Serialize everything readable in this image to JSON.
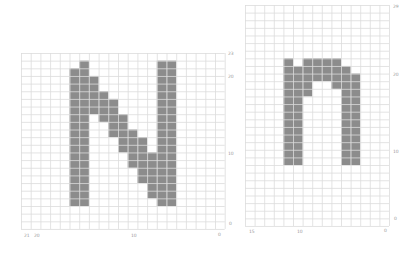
{
  "panels": [
    {
      "id": "left",
      "glyph": "N",
      "origin": [
        21,
        53
      ],
      "cols": 21,
      "rows": 23,
      "cell_w": 9.7,
      "cell_h": 7.65,
      "fill_color": "#8c8c8c",
      "grid_color": "#dcdcdc",
      "filled_columns": [
        {
          "col": 5,
          "from": 2,
          "to": 19
        },
        {
          "col": 6,
          "from": 1,
          "to": 19
        },
        {
          "col": 7,
          "from": 3,
          "to": 7
        },
        {
          "col": 8,
          "from": 5,
          "to": 8
        },
        {
          "col": 9,
          "from": 6,
          "to": 10
        },
        {
          "col": 10,
          "from": 8,
          "to": 12
        },
        {
          "col": 11,
          "from": 10,
          "to": 14
        },
        {
          "col": 12,
          "from": 11,
          "to": 16
        },
        {
          "col": 13,
          "from": 13,
          "to": 18
        },
        {
          "col": 14,
          "from": 1,
          "to": 19
        },
        {
          "col": 15,
          "from": 1,
          "to": 19
        }
      ],
      "y_labels": [
        {
          "text": "23",
          "x": 228,
          "y": 52
        },
        {
          "text": "20",
          "x": 228,
          "y": 75
        },
        {
          "text": "10",
          "x": 228,
          "y": 152
        },
        {
          "text": "0",
          "x": 229,
          "y": 222
        }
      ],
      "x_labels": [
        {
          "text": "21",
          "x": 24,
          "y": 234
        },
        {
          "text": "20",
          "x": 34,
          "y": 234
        },
        {
          "text": "10",
          "x": 131,
          "y": 234
        },
        {
          "text": "0",
          "x": 218,
          "y": 233
        }
      ]
    },
    {
      "id": "right",
      "glyph": "n",
      "origin": [
        245,
        5
      ],
      "cols": 15,
      "rows": 29,
      "cell_w": 9.6,
      "cell_h": 7.62,
      "fill_color": "#8c8c8c",
      "grid_color": "#dcdcdc",
      "filled_columns": [
        {
          "col": 4,
          "from": 7,
          "to": 20
        },
        {
          "col": 5,
          "from": 8,
          "to": 20
        },
        {
          "col": 6,
          "from": 7,
          "to": 11
        },
        {
          "col": 7,
          "from": 7,
          "to": 9
        },
        {
          "col": 8,
          "from": 7,
          "to": 9
        },
        {
          "col": 9,
          "from": 7,
          "to": 10
        },
        {
          "col": 10,
          "from": 8,
          "to": 20
        },
        {
          "col": 11,
          "from": 9,
          "to": 20
        }
      ],
      "y_labels": [
        {
          "text": "29",
          "x": 393,
          "y": 5
        },
        {
          "text": "20",
          "x": 393,
          "y": 73
        },
        {
          "text": "10",
          "x": 393,
          "y": 150
        },
        {
          "text": "0",
          "x": 394,
          "y": 217
        }
      ],
      "x_labels": [
        {
          "text": "15",
          "x": 249,
          "y": 230
        },
        {
          "text": "10",
          "x": 297,
          "y": 230
        },
        {
          "text": "0",
          "x": 384,
          "y": 229
        }
      ]
    }
  ]
}
